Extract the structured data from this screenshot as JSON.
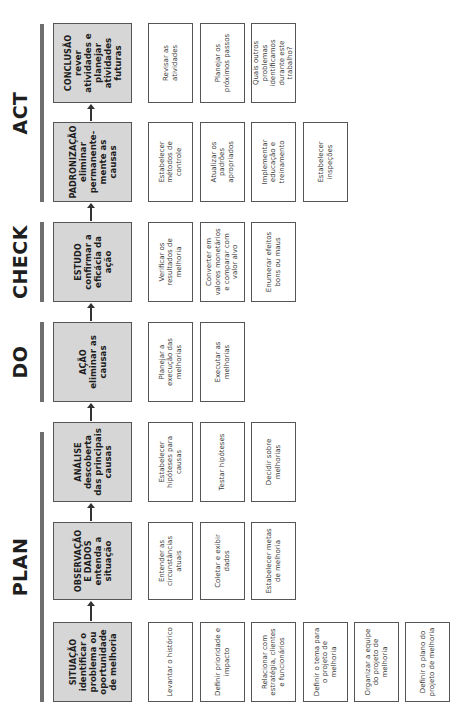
{
  "phases": [
    {
      "id": "plan",
      "label": "PLAN"
    },
    {
      "id": "do",
      "label": "DO"
    },
    {
      "id": "check",
      "label": "CHECK"
    },
    {
      "id": "act",
      "label": "ACT"
    }
  ],
  "steps": [
    {
      "id": "situacao",
      "title": "SITUAÇÃO",
      "desc": "identificar o problema ou oportunidade de melhoria",
      "tasks": [
        "Levantar o histórico",
        "Definir prioridade e impacto",
        "Relacionar com estratégia, clientes e funcionários",
        "Definir o tema para o projeto de melhoria",
        "Organizar a equipe do projeto de melhoria",
        "Definir o plano do projeto de melhoria"
      ]
    },
    {
      "id": "observacao",
      "title": "OBSERVAÇÃO E DADOS",
      "desc": "entenda a situação",
      "tasks": [
        "Entender as circunstâncias atuais",
        "Coletar e exibir dados",
        "Estabelecer metas de melhoria"
      ]
    },
    {
      "id": "analise",
      "title": "ANÁLISE",
      "desc": "descoberta das principais causas",
      "tasks": [
        "Estabelecer hipóteses para causas",
        "Testar hipóteses",
        "Decidir sobre melhorias"
      ]
    },
    {
      "id": "acao",
      "title": "AÇÃO",
      "desc": "eliminar as causas",
      "tasks": [
        "Planejar a execução das melhorias",
        "Executar as melhorias"
      ]
    },
    {
      "id": "estudo",
      "title": "ESTUDO",
      "desc": "confirmar a eficácia da ação",
      "tasks": [
        "Verificar os resultados de melhoria",
        "Converter em valores monetários e comparar com valor alvo",
        "Enumerar efeitos bons ou maus"
      ]
    },
    {
      "id": "padronizacao",
      "title": "PADRONIZAÇÃO",
      "desc": "eliminar permanente-mente as causas",
      "tasks": [
        "Estabelecer métodos de controle",
        "Atualizar os padrões apropriados",
        "Implementar educação e treinamento",
        "Estabelecer inspeções"
      ]
    },
    {
      "id": "conclusao",
      "title": "CONCLUSÃO",
      "desc": "rever atividades e planejar atividades futuras",
      "tasks": [
        "Revisar as atividades",
        "Planejar os próximos passos",
        "Quais outros problemas identificamos durante este trabalho?"
      ]
    }
  ]
}
